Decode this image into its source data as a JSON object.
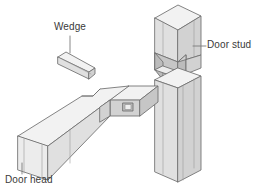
{
  "figure": {
    "background_color": "#ffffff",
    "line_color": "#6e6e6e",
    "text_color": "#3a3a3a",
    "style": "isometric line drawing with flat gray shading"
  },
  "labels": {
    "wedge": "Wedge",
    "door_stud": "Door stud",
    "door_head": "Door head"
  },
  "parts": [
    {
      "name": "wedge",
      "label": "Wedge",
      "description": "small tapered rectangular wedge shown detached above the joint"
    },
    {
      "name": "door-head",
      "label": "Door head",
      "description": "horizontal rectangular beam with a shouldered tenon and a through mortise slot for the wedge"
    },
    {
      "name": "door-stud",
      "label": "Door stud",
      "description": "vertical rectangular post with a tapered mortise housing cut to receive the tenon"
    }
  ],
  "colors": {
    "face_top": "#f2f2f2",
    "face_light": "#ececec",
    "face_side": "#e0e0e0",
    "face_dark": "#d2d2d2",
    "face_deep": "#c6c6c6",
    "face_shadow": "#bcbcbc",
    "edge": "#6e6e6e",
    "edge_soft": "#9a9a9a",
    "leader": "#7a7a7a"
  }
}
